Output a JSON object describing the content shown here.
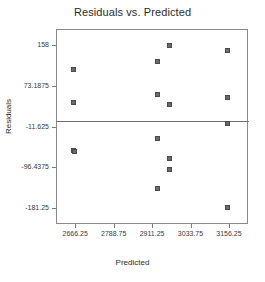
{
  "chart_data": {
    "type": "scatter",
    "title": "Residuals vs. Predicted",
    "xlabel": "Predicted",
    "ylabel": "Residuals",
    "grid": false,
    "legend": "none",
    "xlim": [
      2605,
      3217
    ],
    "ylim": [
      -215,
      192
    ],
    "xticks": [
      2666.25,
      2788.75,
      2911.25,
      3033.75,
      3156.25
    ],
    "xtick_labels": [
      "2666.25",
      "2788.75",
      "2911.25",
      "3033.75",
      "3156.25"
    ],
    "yticks": [
      158,
      73.1875,
      -11.625,
      -96.4375,
      -181.25
    ],
    "ytick_labels": [
      "158",
      "73.1875",
      "-11.625",
      "-96.4375",
      "-181.25"
    ],
    "reference_line": {
      "orientation": "horizontal",
      "y": 0
    },
    "series": [
      {
        "name": "Residuals",
        "marker": "square",
        "color": "#6b6b6b",
        "points": [
          {
            "x": 2662,
            "y": 108
          },
          {
            "x": 2662,
            "y": 38
          },
          {
            "x": 2660,
            "y": -62
          },
          {
            "x": 2663,
            "y": -64
          },
          {
            "x": 2928,
            "y": 124
          },
          {
            "x": 2928,
            "y": 55
          },
          {
            "x": 2928,
            "y": -36
          },
          {
            "x": 2928,
            "y": -140
          },
          {
            "x": 2968,
            "y": 158
          },
          {
            "x": 2968,
            "y": 35
          },
          {
            "x": 2968,
            "y": -78
          },
          {
            "x": 2968,
            "y": -101
          },
          {
            "x": 3152,
            "y": 148
          },
          {
            "x": 3152,
            "y": 48
          },
          {
            "x": 3152,
            "y": -6
          },
          {
            "x": 3152,
            "y": -181
          }
        ]
      }
    ]
  },
  "geometry": {
    "plot_left": 56,
    "plot_top": 29,
    "plot_width": 192,
    "plot_height": 195
  }
}
